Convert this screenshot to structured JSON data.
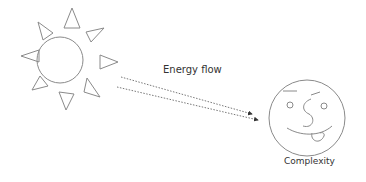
{
  "diagram": {
    "nodes": [
      {
        "id": "sun",
        "kind": "sun-icon"
      },
      {
        "id": "face",
        "kind": "smiley-face-icon",
        "label": "Complexity"
      }
    ],
    "edges": [
      {
        "from": "sun",
        "to": "face",
        "style": "dotted-arrow",
        "label": "Energy flow"
      },
      {
        "from": "sun",
        "to": "face",
        "style": "dotted-arrow"
      }
    ]
  },
  "labels": {
    "energy": "Energy flow",
    "complexity": "Complexity"
  },
  "colors": {
    "stroke": "#8a8a8a",
    "text": "#333333"
  }
}
